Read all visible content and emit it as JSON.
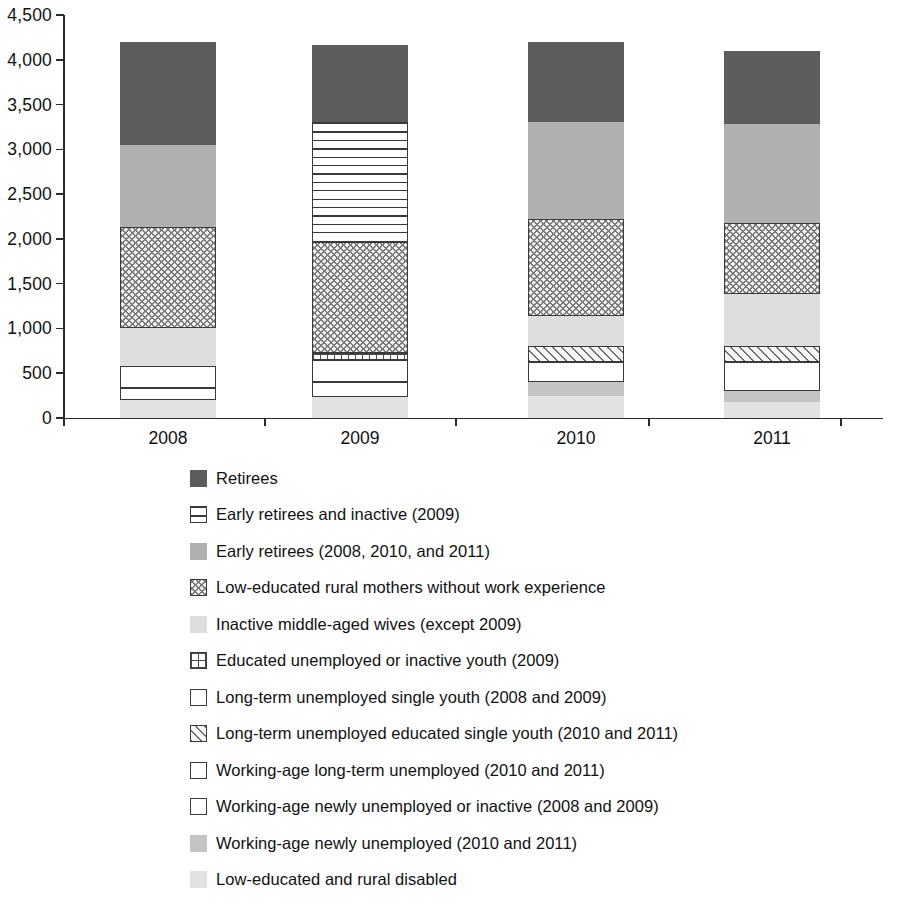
{
  "chart_data": {
    "type": "bar",
    "subtype": "stacked-vertical",
    "title": "",
    "xlabel": "",
    "ylabel": "",
    "categories": [
      "2008",
      "2009",
      "2010",
      "2011"
    ],
    "ylim": [
      0,
      4500
    ],
    "ytick_values": [
      0,
      500,
      1000,
      1500,
      2000,
      2500,
      3000,
      3500,
      4000,
      4500
    ],
    "ytick_labels": [
      "0",
      "500",
      "1,000",
      "1,500",
      "2,000",
      "2,500",
      "3,000",
      "3,500",
      "4,000",
      "4,500"
    ],
    "grid": false,
    "legend_position": "below",
    "totals": [
      4200,
      4170,
      4200,
      4100
    ],
    "series": [
      {
        "name": "Retirees",
        "pattern": "solid-dark-gray",
        "color": "#5c5c5c",
        "values": [
          1150,
          870,
          900,
          820
        ]
      },
      {
        "name": "Early retirees and inactive (2009)",
        "pattern": "horizontal-stripes",
        "color": "#ffffff",
        "values": [
          0,
          1340,
          0,
          0
        ]
      },
      {
        "name": "Early retirees (2008, 2010, and 2011)",
        "pattern": "solid-medium-gray",
        "color": "#b0b0b0",
        "values": [
          920,
          0,
          1080,
          1100
        ]
      },
      {
        "name": "Low-educated rural mothers without work experience",
        "pattern": "crosshatch",
        "color": "#efefef",
        "values": [
          1130,
          1230,
          1080,
          790
        ]
      },
      {
        "name": "Inactive middle-aged wives (except 2009)",
        "pattern": "solid-light-gray",
        "color": "#dedede",
        "values": [
          420,
          0,
          340,
          590
        ]
      },
      {
        "name": "Educated unemployed or inactive youth (2009)",
        "pattern": "fine-grid",
        "color": "#ffffff",
        "values": [
          0,
          80,
          0,
          0
        ]
      },
      {
        "name": "Long-term unemployed single youth (2008 and 2009)",
        "pattern": "white-outline",
        "color": "#ffffff",
        "values": [
          250,
          250,
          0,
          0
        ]
      },
      {
        "name": "Long-term unemployed educated single youth (2010 and 2011)",
        "pattern": "diagonal-hatch",
        "color": "#f4f4f4",
        "values": [
          0,
          0,
          180,
          180
        ]
      },
      {
        "name": "Working-age long-term unemployed (2010 and 2011)",
        "pattern": "white-outline",
        "color": "#ffffff",
        "values": [
          0,
          0,
          220,
          320
        ]
      },
      {
        "name": "Working-age newly unemployed or inactive (2008 and 2009)",
        "pattern": "vertical-stripes",
        "color": "#ffffff",
        "values": [
          130,
          170,
          0,
          0
        ]
      },
      {
        "name": "Working-age newly unemployed  (2010 and 2011)",
        "pattern": "solid-gray",
        "color": "#c4c4c4",
        "values": [
          0,
          0,
          150,
          120
        ]
      },
      {
        "name": "Low-educated and rural disabled",
        "pattern": "solid-pale-gray",
        "color": "#e2e2e2",
        "values": [
          200,
          230,
          250,
          180
        ]
      }
    ],
    "stacks": {
      "2008": [
        {
          "series": "Low-educated and rural disabled",
          "from": 0,
          "to": 200
        },
        {
          "series": "Working-age newly unemployed or inactive (2008 and 2009)",
          "from": 200,
          "to": 330
        },
        {
          "series": "Long-term unemployed single youth (2008 and 2009)",
          "from": 330,
          "to": 580
        },
        {
          "series": "Inactive middle-aged wives (except 2009)",
          "from": 580,
          "to": 1000
        },
        {
          "series": "Low-educated rural mothers without work experience",
          "from": 1000,
          "to": 2130
        },
        {
          "series": "Early retirees (2008, 2010, and 2011)",
          "from": 2130,
          "to": 3050
        },
        {
          "series": "Retirees",
          "from": 3050,
          "to": 4200
        }
      ],
      "2009": [
        {
          "series": "Low-educated and rural disabled",
          "from": 0,
          "to": 230
        },
        {
          "series": "Working-age newly unemployed or inactive (2008 and 2009)",
          "from": 230,
          "to": 400
        },
        {
          "series": "Long-term unemployed single youth (2008 and 2009)",
          "from": 400,
          "to": 650
        },
        {
          "series": "Educated unemployed or inactive youth (2009)",
          "from": 650,
          "to": 730
        },
        {
          "series": "Low-educated rural mothers without work experience",
          "from": 730,
          "to": 1960
        },
        {
          "series": "Early retirees and inactive (2009)",
          "from": 1960,
          "to": 3300
        },
        {
          "series": "Retirees",
          "from": 3300,
          "to": 4170
        }
      ],
      "2010": [
        {
          "series": "Low-educated and rural disabled",
          "from": 0,
          "to": 250
        },
        {
          "series": "Working-age newly unemployed  (2010 and 2011)",
          "from": 250,
          "to": 400
        },
        {
          "series": "Working-age long-term unemployed (2010 and 2011)",
          "from": 400,
          "to": 620
        },
        {
          "series": "Long-term unemployed educated single youth (2010 and 2011)",
          "from": 620,
          "to": 800
        },
        {
          "series": "Inactive middle-aged wives (except 2009)",
          "from": 800,
          "to": 1140
        },
        {
          "series": "Low-educated rural mothers without work experience",
          "from": 1140,
          "to": 2220
        },
        {
          "series": "Early retirees (2008, 2010, and 2011)",
          "from": 2220,
          "to": 3300
        },
        {
          "series": "Retirees",
          "from": 3300,
          "to": 4200
        }
      ],
      "2011": [
        {
          "series": "Low-educated and rural disabled",
          "from": 0,
          "to": 180
        },
        {
          "series": "Working-age newly unemployed  (2010 and 2011)",
          "from": 180,
          "to": 300
        },
        {
          "series": "Working-age long-term unemployed (2010 and 2011)",
          "from": 300,
          "to": 620
        },
        {
          "series": "Long-term unemployed educated single youth (2010 and 2011)",
          "from": 620,
          "to": 800
        },
        {
          "series": "Inactive middle-aged wives (except 2009)",
          "from": 800,
          "to": 1390
        },
        {
          "series": "Low-educated rural mothers without work experience",
          "from": 1390,
          "to": 2180
        },
        {
          "series": "Early retirees (2008, 2010, and 2011)",
          "from": 2180,
          "to": 3280
        },
        {
          "series": "Retirees",
          "from": 3280,
          "to": 4100
        }
      ]
    }
  },
  "legend": {
    "items": [
      {
        "label": "Retirees",
        "pattern": "solid-dark-gray"
      },
      {
        "label": "Early retirees and inactive (2009)",
        "pattern": "horizontal-stripes"
      },
      {
        "label": "Early retirees (2008, 2010, and 2011)",
        "pattern": "solid-medium-gray"
      },
      {
        "label": "Low-educated rural mothers without work experience",
        "pattern": "crosshatch"
      },
      {
        "label": "Inactive middle-aged wives (except 2009)",
        "pattern": "solid-light-gray"
      },
      {
        "label": "Educated unemployed or inactive youth (2009)",
        "pattern": "fine-grid"
      },
      {
        "label": "Long-term unemployed single youth (2008 and 2009)",
        "pattern": "white-outline"
      },
      {
        "label": "Long-term unemployed educated single youth (2010 and 2011)",
        "pattern": "diagonal-hatch"
      },
      {
        "label": "Working-age long-term unemployed (2010 and 2011)",
        "pattern": "white-outline"
      },
      {
        "label": "Working-age newly unemployed or inactive (2008 and 2009)",
        "pattern": "vertical-stripes"
      },
      {
        "label": "Working-age newly unemployed  (2010 and 2011)",
        "pattern": "solid-gray"
      },
      {
        "label": "Low-educated and rural disabled",
        "pattern": "solid-pale-gray"
      }
    ]
  }
}
